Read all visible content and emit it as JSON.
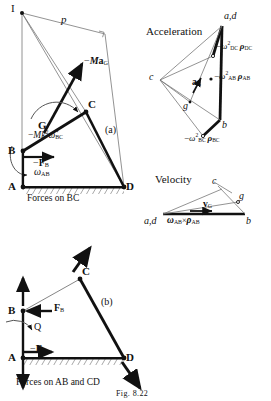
{
  "figure": {
    "caption": "Fig. 8.22",
    "panels": {
      "a": {
        "tag": "(a)",
        "title": "Forces on BC",
        "points": [
          {
            "id": "I",
            "label": "I",
            "x": 14,
            "y": 10
          },
          {
            "id": "B",
            "label": "B",
            "x": 12,
            "y": 150
          },
          {
            "id": "A",
            "label": "A",
            "x": 12,
            "y": 186
          },
          {
            "id": "D",
            "label": "D",
            "x": 124,
            "y": 186
          },
          {
            "id": "C",
            "label": "C",
            "x": 86,
            "y": 105
          },
          {
            "id": "G",
            "label": "G",
            "x": 48,
            "y": 125
          }
        ],
        "labels": {
          "p": "p",
          "inertia_force": "−Ma_G",
          "inertia_couple": "−Mk²ω̇_BC",
          "force_b": "−F_B",
          "omega_ab": "ω_AB"
        }
      },
      "acceleration": {
        "title": "Acceleration",
        "points": [
          {
            "id": "ad",
            "label": "a,d",
            "x": 228,
            "y": 20
          },
          {
            "id": "c",
            "label": "c",
            "x": 150,
            "y": 77
          },
          {
            "id": "g",
            "label": "g",
            "x": 182,
            "y": 100
          },
          {
            "id": "b",
            "label": "b",
            "x": 221,
            "y": 125
          }
        ],
        "labels": {
          "dc_term": "−ω²_DC ρ_DC",
          "ab_term": "−ω²_AB ρ_AB",
          "bc_term": "−ω²_BC ρ_BC",
          "a_g": "a_G"
        }
      },
      "velocity": {
        "title": "Velocity",
        "points": [
          {
            "id": "ad",
            "label": "a,d",
            "x": 148,
            "y": 219
          },
          {
            "id": "b",
            "label": "b",
            "x": 248,
            "y": 219
          },
          {
            "id": "c",
            "label": "c",
            "x": 219,
            "y": 181
          },
          {
            "id": "g",
            "label": "g",
            "x": 240,
            "y": 197
          }
        ],
        "labels": {
          "omega_rho": "ω_AB × ρ_AB",
          "v_g": "v_G"
        }
      },
      "b": {
        "tag": "(b)",
        "title": "Forces on AB and CD",
        "points": [
          {
            "id": "B",
            "label": "B",
            "x": 12,
            "y": 310
          },
          {
            "id": "A",
            "label": "A",
            "x": 12,
            "y": 357
          },
          {
            "id": "D",
            "label": "D",
            "x": 124,
            "y": 357
          },
          {
            "id": "C",
            "label": "C",
            "x": 80,
            "y": 272
          }
        ],
        "labels": {
          "force_b_pos": "F_B",
          "force_b_neg": "−F_B",
          "couple_q": "Q"
        }
      }
    }
  },
  "colors": {
    "ink": "#111111",
    "thin": "#555555",
    "hatch": "#333333"
  }
}
